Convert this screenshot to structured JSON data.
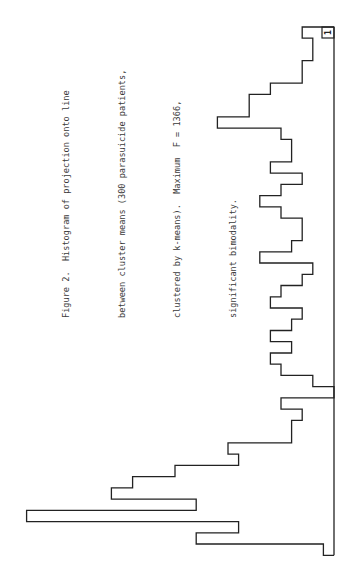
{
  "caption": {
    "lines": [
      "Figure 2.  Histogram of projection onto line",
      "between cluster means (300 parasuicide patients,",
      "clustered by k-means).  Maximum  F = 1366,",
      "significant bimodality."
    ]
  },
  "label_box": "1",
  "chart_data": {
    "type": "bar",
    "orientation": "horizontal (rotated 90°, bars extend left from baseline on right)",
    "title": "Figure 2. Histogram of projection onto line between cluster means (300 parasuicide patients, clustered by k-means). Maximum F = 1366, significant bimodality.",
    "xlabel": "",
    "ylabel": "",
    "n": 300,
    "max_F": 1366,
    "annotation": "1",
    "bin_order": "top-to-bottom in image",
    "values": [
      3,
      2,
      2,
      3,
      3,
      6,
      8,
      8,
      11,
      5,
      4,
      4,
      6,
      3,
      5,
      7,
      5,
      3,
      3,
      4,
      7,
      2,
      3,
      5,
      6,
      3,
      4,
      6,
      4,
      6,
      5,
      2,
      0,
      5,
      3,
      4,
      4,
      10,
      9,
      15,
      19,
      21,
      13,
      29,
      9,
      13,
      1
    ],
    "grid": false,
    "legend": null
  },
  "render": {
    "baseline_x": 334,
    "top_y": 27,
    "bin_px": 11.24,
    "unit_px": 10.6,
    "stroke": "#222222"
  }
}
